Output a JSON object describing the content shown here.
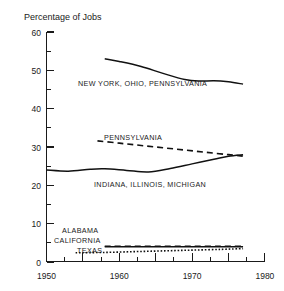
{
  "chart_data": {
    "type": "line",
    "title": "Percentage of Jobs",
    "xlabel": "",
    "ylabel": "",
    "xlim": [
      1950,
      1980
    ],
    "ylim": [
      0,
      60
    ],
    "grid": false,
    "legend": "inline-annotations",
    "x_ticks": [
      1950,
      1960,
      1970,
      1980
    ],
    "x_tick_labels": [
      "1950",
      "1960",
      "1970",
      "1980"
    ],
    "x_minor_ticks": [
      1955,
      1965,
      1975
    ],
    "y_ticks": [
      0,
      10,
      20,
      30,
      40,
      50,
      60
    ],
    "y_tick_labels": [
      "0",
      "10",
      "20",
      "30",
      "40",
      "50",
      "60"
    ],
    "y_minor_ticks": [
      5,
      15,
      25,
      35,
      45,
      55
    ],
    "series": [
      {
        "name": "NEW YORK, OHIO, PENNSYLVANIA",
        "style": "solid",
        "label": "NEW YORK, OHIO, PENNSYLVANIA",
        "x": [
          1958,
          1960,
          1963,
          1966,
          1969,
          1971,
          1973,
          1975,
          1977
        ],
        "values": [
          53.0,
          52.3,
          51.0,
          49.2,
          47.6,
          47.2,
          47.3,
          47.0,
          46.4
        ]
      },
      {
        "name": "PENNSYLVANIA",
        "style": "dashed",
        "label": "PENNSYLVANIA",
        "x": [
          1957,
          1960,
          1963,
          1966,
          1969,
          1972,
          1975,
          1977
        ],
        "values": [
          31.6,
          31.0,
          30.4,
          29.8,
          29.2,
          28.6,
          28.0,
          27.6
        ]
      },
      {
        "name": "INDIANA, ILLINOIS, MICHIGAN",
        "style": "solid",
        "label": "INDIANA, ILLINOIS, MICHIGAN",
        "x": [
          1950,
          1953,
          1956,
          1958,
          1961,
          1964,
          1967,
          1970,
          1973,
          1975,
          1977
        ],
        "values": [
          24.0,
          23.7,
          24.2,
          24.3,
          23.9,
          23.5,
          24.4,
          25.6,
          26.8,
          27.6,
          28.0
        ]
      },
      {
        "name": "ALABAMA",
        "style": "solid",
        "label": "ALABAMA",
        "x": [
          1958,
          1962,
          1966,
          1970,
          1974,
          1977
        ],
        "values": [
          4.0,
          4.0,
          4.0,
          4.0,
          4.0,
          4.0
        ]
      },
      {
        "name": "CALIFORNIA",
        "style": "dashed",
        "label": "CALIFORNIA",
        "x": [
          1958,
          1962,
          1966,
          1970,
          1974,
          1977
        ],
        "values": [
          4.1,
          4.1,
          4.1,
          4.1,
          4.1,
          4.1
        ]
      },
      {
        "name": "TEXAS",
        "style": "dotted",
        "label": "TEXAS",
        "x": [
          1954,
          1958,
          1962,
          1966,
          1970,
          1974,
          1977
        ],
        "values": [
          2.4,
          2.5,
          2.7,
          2.9,
          3.1,
          3.3,
          3.5
        ]
      }
    ],
    "annotations": [
      {
        "text": "NEW YORK, OHIO, PENNSYLVANIA",
        "x": 1959,
        "y": 45.5
      },
      {
        "text": "PENNSYLVANIA",
        "x": 1960.5,
        "y": 32.0
      },
      {
        "text": "INDIANA, ILLINOIS, MICHIGAN",
        "x": 1960.2,
        "y": 19.6
      },
      {
        "text": "ALABAMA",
        "x": 1955.4,
        "y": 8.2
      },
      {
        "text": "CALIFORNIA",
        "x": 1953.6,
        "y": 5.6
      },
      {
        "text": "TEXAS",
        "x": 1956.2,
        "y": 3.0
      }
    ]
  }
}
